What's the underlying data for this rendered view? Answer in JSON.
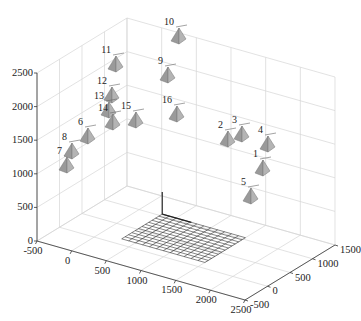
{
  "chart_data": {
    "type": "scatter",
    "subtype": "3d-camera-poses",
    "title": "",
    "xlabel": "",
    "ylabel": "",
    "zlabel": "",
    "x_ticks": [
      -500,
      0,
      500,
      1000,
      1500,
      2000,
      2500
    ],
    "y_ticks": [
      -500,
      0,
      500,
      1000,
      1500
    ],
    "z_ticks": [
      0,
      500,
      1000,
      1500,
      2000,
      2500
    ],
    "xlim": [
      -500,
      2500
    ],
    "ylim": [
      -500,
      1500
    ],
    "zlim": [
      0,
      2500
    ],
    "grid": true,
    "legend": null,
    "annotations": [
      "calibration checkerboard plane near origin"
    ],
    "cameras": [
      {
        "id": "1",
        "px": 262,
        "py": 168
      },
      {
        "id": "2",
        "px": 227,
        "py": 139
      },
      {
        "id": "3",
        "px": 241,
        "py": 134
      },
      {
        "id": "4",
        "px": 267,
        "py": 144
      },
      {
        "id": "5",
        "px": 250,
        "py": 196
      },
      {
        "id": "6",
        "px": 87,
        "py": 136
      },
      {
        "id": "7",
        "px": 66,
        "py": 165
      },
      {
        "id": "8",
        "px": 71,
        "py": 151
      },
      {
        "id": "9",
        "px": 167,
        "py": 75
      },
      {
        "id": "10",
        "px": 178,
        "py": 36
      },
      {
        "id": "11",
        "px": 115,
        "py": 64
      },
      {
        "id": "12",
        "px": 111,
        "py": 95
      },
      {
        "id": "13",
        "px": 108,
        "py": 110
      },
      {
        "id": "14",
        "px": 112,
        "py": 122
      },
      {
        "id": "15",
        "px": 135,
        "py": 120
      },
      {
        "id": "16",
        "px": 176,
        "py": 114
      }
    ]
  },
  "labels": {
    "x_ticks": [
      "-500",
      "0",
      "500",
      "1000",
      "1500",
      "2000",
      "2500"
    ],
    "y_ticks": [
      "-500",
      "0",
      "500",
      "1000",
      "1500"
    ],
    "z_ticks": [
      "0",
      "500",
      "1000",
      "1500",
      "2000",
      "2500"
    ]
  }
}
